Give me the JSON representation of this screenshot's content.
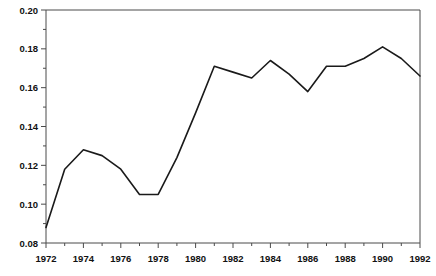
{
  "chart_data": {
    "type": "line",
    "title": "Claims on the United States, 1972-92",
    "xlabel": "",
    "ylabel": "",
    "x": [
      1972,
      1973,
      1974,
      1975,
      1976,
      1977,
      1978,
      1979,
      1980,
      1981,
      1982,
      1983,
      1984,
      1985,
      1986,
      1987,
      1988,
      1989,
      1990,
      1991,
      1992
    ],
    "values": [
      0.088,
      0.118,
      0.128,
      0.125,
      0.118,
      0.105,
      0.105,
      0.124,
      0.147,
      0.171,
      0.168,
      0.165,
      0.174,
      0.167,
      0.158,
      0.171,
      0.171,
      0.175,
      0.181,
      0.175,
      0.166
    ],
    "series": [
      {
        "name": "Claims on the United States",
        "values": [
          0.088,
          0.118,
          0.128,
          0.125,
          0.118,
          0.105,
          0.105,
          0.124,
          0.147,
          0.171,
          0.168,
          0.165,
          0.174,
          0.167,
          0.158,
          0.171,
          0.171,
          0.175,
          0.181,
          0.175,
          0.166
        ]
      }
    ],
    "xlim": [
      1972,
      1992
    ],
    "ylim": [
      0.08,
      0.2
    ],
    "ytick_labels": [
      "0.08",
      "0.10",
      "0.12",
      "0.14",
      "0.16",
      "0.18",
      "0.20"
    ],
    "ytick_values": [
      0.08,
      0.1,
      0.12,
      0.14,
      0.16,
      0.18,
      0.2
    ],
    "yminor_values": [
      0.09,
      0.11,
      0.13,
      0.15,
      0.17,
      0.19
    ],
    "xtick_labels": [
      "1972",
      "1974",
      "1976",
      "1978",
      "1980",
      "1982",
      "1984",
      "1986",
      "1988",
      "1990",
      "1992"
    ],
    "xtick_values": [
      1972,
      1974,
      1976,
      1978,
      1980,
      1982,
      1984,
      1986,
      1988,
      1990,
      1992
    ],
    "xminor_values": [
      1973,
      1975,
      1977,
      1979,
      1981,
      1983,
      1985,
      1987,
      1989,
      1991
    ],
    "grid": false,
    "legend": false,
    "line_color": "#1a1a1a",
    "axis_color": "#4a4a4a",
    "background_color": "#ffffff"
  }
}
